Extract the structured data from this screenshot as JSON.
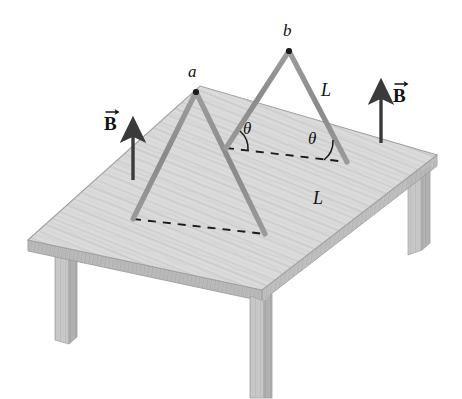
{
  "figure": {
    "type": "physics-diagram",
    "canvas": {
      "width": 462,
      "height": 399
    },
    "background_color": "#ffffff"
  },
  "colors": {
    "table_top": "#d6d6d6",
    "table_top_light": "#e2e2e2",
    "table_edge": "#b9b9b9",
    "table_edge_dark": "#a8a8a8",
    "table_leg": "#c9c9c9",
    "table_leg_shadow": "#b0b0b0",
    "wire": "#8f8f8f",
    "wire_dark": "#7d7d7d",
    "wood_grain": "#bdbdbd",
    "outline": "#9a9a9a",
    "dashed_line": "#1a1a1a",
    "arrow": "#3a3a3a",
    "text": "#111111"
  },
  "labels": {
    "point_a": "a",
    "point_b": "b",
    "length_upper": "L",
    "length_lower": "L",
    "theta_left": "θ",
    "theta_right": "θ",
    "b_field_left": "B",
    "b_field_right": "B"
  },
  "geometry": {
    "table_top_polygon": [
      [
        28,
        240
      ],
      [
        200,
        86
      ],
      [
        437,
        155
      ],
      [
        262,
        290
      ]
    ],
    "table_top_thickness": 11,
    "legs": [
      {
        "name": "front-leg",
        "x": 262,
        "y": 290,
        "width": 15,
        "height": 108
      },
      {
        "name": "left-leg",
        "x": 55,
        "y": 252,
        "width": 14,
        "height": 92
      },
      {
        "name": "right-leg",
        "x": 408,
        "y": 167,
        "width": 14,
        "height": 88
      }
    ],
    "loop_a": {
      "apex": [
        196,
        92
      ],
      "base_left": [
        133,
        219
      ],
      "base_right": [
        265,
        234
      ]
    },
    "loop_b": {
      "apex": [
        289,
        51
      ],
      "base_left": [
        226,
        148
      ],
      "base_right": [
        347,
        162
      ]
    },
    "dashed_lines": [
      {
        "name": "base-line-a",
        "from": [
          133,
          219
        ],
        "to": [
          265,
          234
        ]
      },
      {
        "name": "base-line-b",
        "from": [
          226,
          148
        ],
        "to": [
          347,
          162
        ]
      }
    ],
    "field_arrows": [
      {
        "name": "left-field-arrow",
        "x": 133,
        "y_tail": 178,
        "y_head": 126
      },
      {
        "name": "right-field-arrow",
        "x": 381,
        "y_tail": 140,
        "y_head": 88
      }
    ],
    "label_positions": {
      "point_a": [
        186,
        72
      ],
      "point_b": [
        281,
        31
      ],
      "length_upper": [
        322,
        86
      ],
      "length_lower": [
        314,
        193
      ],
      "theta_left": [
        243,
        125
      ],
      "theta_right": [
        310,
        132
      ],
      "b_field_left": [
        104,
        113
      ],
      "b_field_right": [
        392,
        85
      ]
    }
  }
}
